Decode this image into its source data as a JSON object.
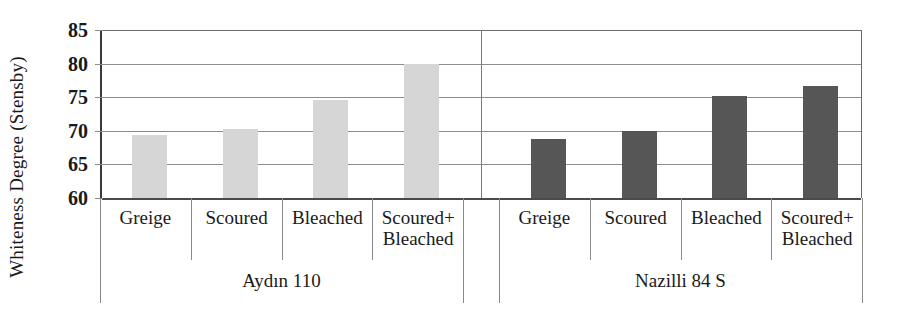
{
  "chart_data": {
    "type": "bar",
    "title": "",
    "subtitle": "",
    "xlabel": "",
    "ylabel": "Whiteness Degree (Stensby)",
    "ylim": [
      60,
      85
    ],
    "ytick_step": 5,
    "yticks": [
      85,
      80,
      75,
      70,
      65,
      60
    ],
    "grid": true,
    "legend": "none",
    "categories": [
      "Greige",
      "Scoured",
      "Bleached",
      "Scoured+\nBleached"
    ],
    "groups": [
      {
        "name": "Aydın 110",
        "color": "#d6d6d6",
        "values": [
          69.4,
          70.2,
          74.6,
          80.0
        ]
      },
      {
        "name": "Nazilli 84  S",
        "color": "#565656",
        "values": [
          68.8,
          70.0,
          75.2,
          76.7
        ]
      }
    ],
    "series": [
      {
        "name": "Aydın 110",
        "values": [
          69.4,
          70.2,
          74.6,
          80.0
        ]
      },
      {
        "name": "Nazilli 84  S",
        "values": [
          68.8,
          70.0,
          75.2,
          76.7
        ]
      }
    ],
    "colors": {
      "series_light": "#d6d6d6",
      "series_dark": "#565656",
      "gridline": "#8c8c8c",
      "axis": "#4a4a4a",
      "text": "#1a1a1a"
    }
  },
  "axis": {
    "y_title": "Whiteness Degree (Stensby)",
    "tick_labels": [
      "85",
      "80",
      "75",
      "70",
      "65",
      "60"
    ]
  }
}
